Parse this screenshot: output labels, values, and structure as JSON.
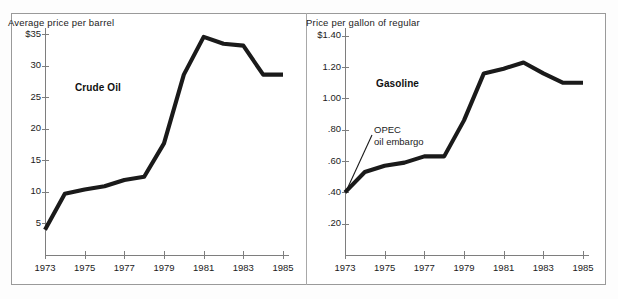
{
  "figure": {
    "background_color": "#ffffff",
    "frame_color": "#9a9a9a",
    "line_color": "#1a1a1a",
    "axis_color": "#7e7e7e"
  },
  "chart_data": [
    {
      "type": "line",
      "title": "Average price per barrel",
      "series_label": "Crude Oil",
      "xlabel": "",
      "ylabel": "",
      "grid": false,
      "legend": "none",
      "xlim": [
        1973,
        1985
      ],
      "ylim": [
        0,
        36
      ],
      "xticks": [
        "1973",
        "1975",
        "1977",
        "1979",
        "1981",
        "1983",
        "1985"
      ],
      "xtick_values": [
        1973,
        1975,
        1977,
        1979,
        1981,
        1983,
        1985
      ],
      "yticks": [
        "$35",
        "30",
        "25",
        "20",
        "15",
        "10",
        "5"
      ],
      "ytick_values": [
        35,
        30,
        25,
        20,
        15,
        10,
        5
      ],
      "x": [
        1973,
        1974,
        1975,
        1976,
        1977,
        1978,
        1979,
        1980,
        1981,
        1982,
        1983,
        1984,
        1985
      ],
      "values": [
        4.0,
        9.7,
        10.4,
        10.9,
        11.9,
        12.4,
        17.7,
        28.6,
        34.6,
        33.5,
        33.2,
        28.6,
        28.6
      ]
    },
    {
      "type": "line",
      "title": "Price per gallon of regular",
      "series_label": "Gasoline",
      "xlabel": "",
      "ylabel": "",
      "grid": false,
      "legend": "none",
      "xlim": [
        1973,
        1985
      ],
      "ylim": [
        0,
        1.45
      ],
      "xticks": [
        "1973",
        "1975",
        "1977",
        "1979",
        "1981",
        "1983",
        "1985"
      ],
      "xtick_values": [
        1973,
        1975,
        1977,
        1979,
        1981,
        1983,
        1985
      ],
      "yticks": [
        "$1.40",
        "1.20",
        "1.00",
        ".80",
        ".60",
        ".40",
        ".20"
      ],
      "ytick_values": [
        1.4,
        1.2,
        1.0,
        0.8,
        0.6,
        0.4,
        0.2
      ],
      "x": [
        1973,
        1974,
        1975,
        1976,
        1977,
        1978,
        1979,
        1980,
        1981,
        1982,
        1983,
        1984,
        1985
      ],
      "values": [
        0.4,
        0.53,
        0.57,
        0.59,
        0.63,
        0.63,
        0.86,
        1.16,
        1.19,
        1.23,
        1.16,
        1.1,
        1.1
      ],
      "annotations": [
        {
          "text_line1": "OPEC",
          "text_line2": "oil embargo",
          "points_to_year": 1973,
          "points_to_value": 0.4
        }
      ]
    }
  ]
}
